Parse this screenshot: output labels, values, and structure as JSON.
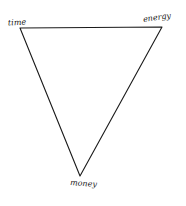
{
  "diagram": {
    "type": "triangle",
    "stroke_color": "#1a1a1a",
    "background": "#ffffff",
    "vertices": [
      {
        "id": "time",
        "label": "time",
        "x": 20,
        "y": 28
      },
      {
        "id": "energy",
        "label": "energy",
        "x": 162,
        "y": 27
      },
      {
        "id": "money",
        "label": "money",
        "x": 80,
        "y": 176
      }
    ]
  }
}
